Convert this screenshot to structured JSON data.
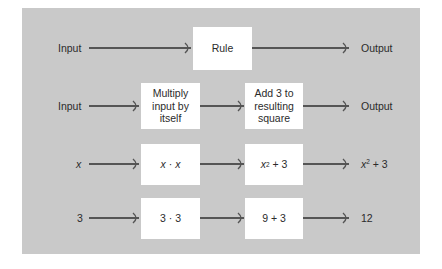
{
  "diagram": {
    "title": "",
    "colors": {
      "panel_background": "#c9c9c9",
      "box_fill": "#ffffff",
      "arrow": "#555555",
      "text": "#2b2b2b"
    },
    "rows": [
      {
        "input": "Input",
        "steps": [
          "Rule"
        ],
        "output": "Output"
      },
      {
        "input": "Input",
        "steps": [
          "Multiply input by itself",
          "Add 3 to resulting square"
        ],
        "output": "Output"
      },
      {
        "input": "x",
        "steps": [
          "x · x",
          "x² + 3"
        ],
        "output": "x² + 3"
      },
      {
        "input": "3",
        "steps": [
          "3 · 3",
          "9 + 3"
        ],
        "output": "12"
      }
    ]
  },
  "row1": {
    "input": "Input",
    "rule": "Rule",
    "output": "Output"
  },
  "row2": {
    "input": "Input",
    "step1": {
      "line1": "Multiply",
      "line2": "input by",
      "line3": "itself"
    },
    "step2": {
      "line1": "Add 3 to",
      "line2": "resulting",
      "line3": "square"
    },
    "output": "Output"
  },
  "row3": {
    "input": "x",
    "step1": {
      "a": "x",
      "op": " · ",
      "b": "x"
    },
    "step2": {
      "base": "x",
      "exp": "2",
      "rest": " + 3"
    },
    "output": {
      "base": "x",
      "exp": "2",
      "rest": " + 3"
    }
  },
  "row4": {
    "input": "3",
    "step1": "3 · 3",
    "step2": "9 + 3",
    "output": "12"
  }
}
